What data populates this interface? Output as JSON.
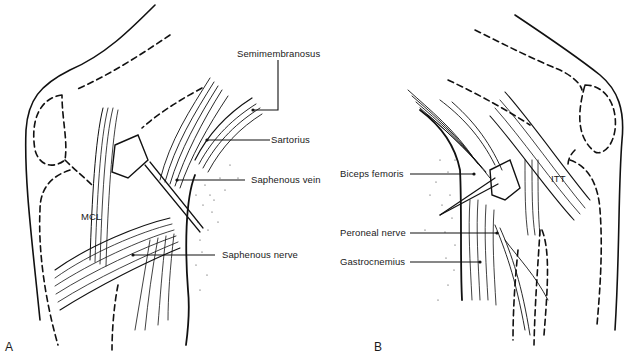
{
  "figure": {
    "panels": [
      {
        "id": "A",
        "letter": "A",
        "labels": {
          "semimembranosus": "Semimembranosus",
          "sartorius": "Sartorius",
          "saphenous_vein": "Saphenous vein",
          "mcl": "MCL",
          "saphenous_nerve": "Saphenous nerve"
        }
      },
      {
        "id": "B",
        "letter": "B",
        "labels": {
          "biceps_femoris": "Biceps femoris",
          "itt": "ITT",
          "peroneal_nerve": "Peroneal nerve",
          "gastrocnemius": "Gastrocnemius"
        }
      }
    ],
    "colors": {
      "line": "#111111",
      "background": "#ffffff",
      "stipple": "#333333"
    }
  }
}
